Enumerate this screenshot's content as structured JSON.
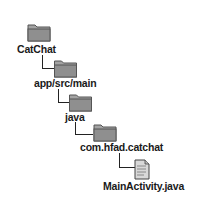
{
  "tree": {
    "nodes": [
      {
        "label": "CatChat",
        "type": "folder",
        "icon": "folder-icon"
      },
      {
        "label": "app/src/main",
        "type": "folder",
        "icon": "folder-icon"
      },
      {
        "label": "java",
        "type": "folder",
        "icon": "folder-icon"
      },
      {
        "label": "com.hfad.catchat",
        "type": "folder",
        "icon": "folder-icon"
      },
      {
        "label": "MainActivity.java",
        "type": "file",
        "icon": "java-file-icon"
      }
    ]
  },
  "colors": {
    "folder_fill": "#9a9a9a",
    "folder_edge": "#555555",
    "connector": "#222222",
    "text": "#1a1a1a"
  }
}
